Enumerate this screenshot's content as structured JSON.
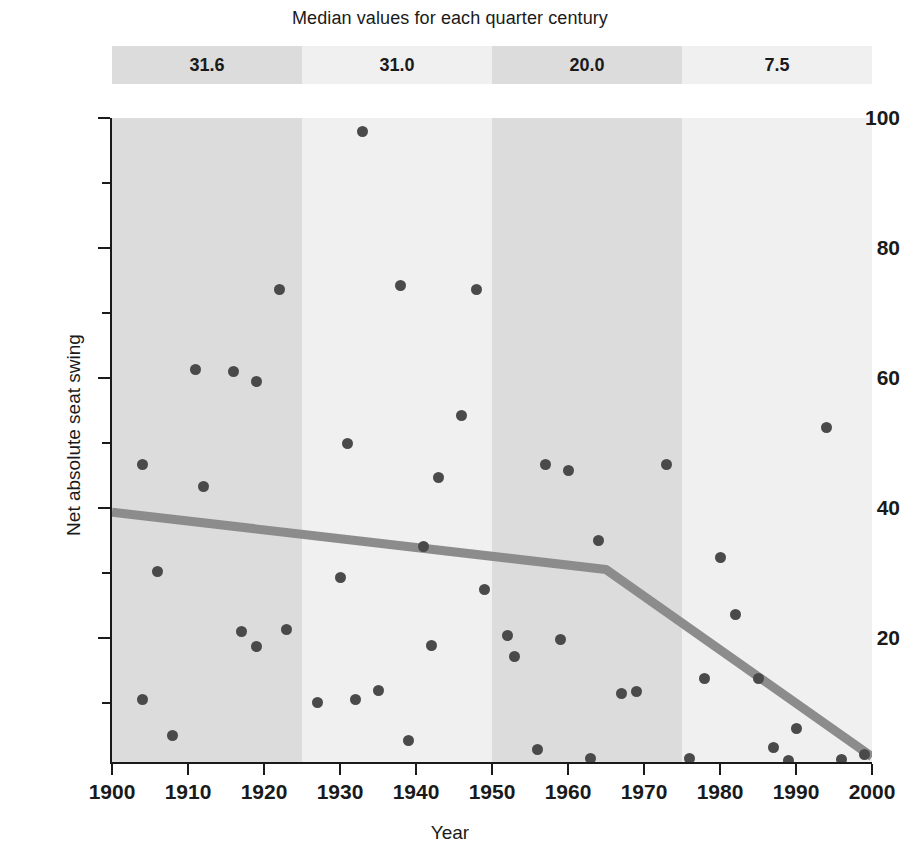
{
  "header": {
    "band_title": "Median values for each quarter century"
  },
  "chart_data": {
    "type": "scatter",
    "title": "",
    "xlabel": "Year",
    "ylabel": "Net absolute seat swing",
    "xlim": [
      1900,
      2000
    ],
    "ylim": [
      1,
      100
    ],
    "grid": false,
    "legend": "none",
    "x_ticks": [
      1900,
      1910,
      1920,
      1930,
      1940,
      1950,
      1960,
      1970,
      1980,
      1990,
      2000
    ],
    "y_ticks": [
      20,
      40,
      60,
      80,
      100
    ],
    "y_minor_ticks": [
      10,
      30,
      50,
      70,
      90
    ],
    "point_color": "#4a4a4a",
    "trend_color": "#8c8c8c",
    "quarter_bands": [
      {
        "label": "31.6",
        "start": 1900,
        "end": 1925,
        "median": 31.6,
        "color": "#dcdcdc"
      },
      {
        "label": "31.0",
        "start": 1925,
        "end": 1950,
        "median": 31.0,
        "color": "#f0f0f0"
      },
      {
        "label": "20.0",
        "start": 1950,
        "end": 1975,
        "median": 20.0,
        "color": "#dcdcdc"
      },
      {
        "label": "7.5",
        "start": 1975,
        "end": 2000,
        "median": 7.5,
        "color": "#f0f0f0"
      }
    ],
    "points": [
      {
        "x": 1904,
        "y": 46.8
      },
      {
        "x": 1904,
        "y": 10.6
      },
      {
        "x": 1906,
        "y": 30.3
      },
      {
        "x": 1908,
        "y": 5.0
      },
      {
        "x": 1911,
        "y": 61.4
      },
      {
        "x": 1912,
        "y": 43.4
      },
      {
        "x": 1916,
        "y": 61.0
      },
      {
        "x": 1917,
        "y": 21.0
      },
      {
        "x": 1919,
        "y": 59.5
      },
      {
        "x": 1919,
        "y": 18.8
      },
      {
        "x": 1922,
        "y": 73.7
      },
      {
        "x": 1923,
        "y": 21.4
      },
      {
        "x": 1927,
        "y": 10.2
      },
      {
        "x": 1930,
        "y": 29.3
      },
      {
        "x": 1931,
        "y": 49.9
      },
      {
        "x": 1932,
        "y": 10.6
      },
      {
        "x": 1933,
        "y": 98.0
      },
      {
        "x": 1935,
        "y": 12.0
      },
      {
        "x": 1938,
        "y": 74.2
      },
      {
        "x": 1939,
        "y": 4.3
      },
      {
        "x": 1941,
        "y": 34.1
      },
      {
        "x": 1942,
        "y": 18.9
      },
      {
        "x": 1943,
        "y": 44.8
      },
      {
        "x": 1946,
        "y": 54.3
      },
      {
        "x": 1948,
        "y": 73.7
      },
      {
        "x": 1949,
        "y": 27.5
      },
      {
        "x": 1952,
        "y": 20.4
      },
      {
        "x": 1953,
        "y": 17.2
      },
      {
        "x": 1956,
        "y": 2.9
      },
      {
        "x": 1957,
        "y": 46.8
      },
      {
        "x": 1959,
        "y": 19.8
      },
      {
        "x": 1960,
        "y": 45.8
      },
      {
        "x": 1963,
        "y": 1.6
      },
      {
        "x": 1964,
        "y": 35.1
      },
      {
        "x": 1967,
        "y": 11.5
      },
      {
        "x": 1969,
        "y": 11.8
      },
      {
        "x": 1973,
        "y": 46.8
      },
      {
        "x": 1976,
        "y": 1.6
      },
      {
        "x": 1978,
        "y": 13.8
      },
      {
        "x": 1980,
        "y": 32.4
      },
      {
        "x": 1982,
        "y": 23.6
      },
      {
        "x": 1985,
        "y": 13.8
      },
      {
        "x": 1987,
        "y": 3.3
      },
      {
        "x": 1989,
        "y": 1.3
      },
      {
        "x": 1990,
        "y": 6.1
      },
      {
        "x": 1994,
        "y": 52.4
      },
      {
        "x": 1996,
        "y": 1.4
      },
      {
        "x": 1999,
        "y": 2.1
      }
    ],
    "trend_line": {
      "name": "segmented median trend",
      "vertices": [
        {
          "x": 1900,
          "y": 39.4
        },
        {
          "x": 1965,
          "y": 30.6
        },
        {
          "x": 2000,
          "y": 1.8
        }
      ]
    }
  }
}
